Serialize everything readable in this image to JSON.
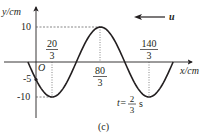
{
  "figure": {
    "caption": "(c)",
    "y_axis_label": "y/cm",
    "x_axis_label": "x/cm",
    "origin_label": "O",
    "y_ticks": [
      {
        "label": "10",
        "value": 10
      },
      {
        "label": "-5",
        "value": -5
      },
      {
        "label": "-10",
        "value": -10
      }
    ],
    "x_ticks": [
      {
        "num": "20",
        "den": "3",
        "value": 6.667
      },
      {
        "num": "80",
        "den": "3",
        "value": 26.667
      },
      {
        "num": "140",
        "den": "3",
        "value": 46.667
      }
    ],
    "velocity_label": "u",
    "velocity_direction": "left",
    "time_label": {
      "prefix": "t=",
      "num": "2",
      "den": "3",
      "unit": "s"
    },
    "wave": {
      "amplitude_cm": 10,
      "wavelength_cm": 40,
      "peak_x_cm": 26.667,
      "x_start_cm": -3.333,
      "x_end_cm": 56.667
    },
    "colors": {
      "ink": "#231f20",
      "dashed": "#555555"
    }
  },
  "chart_data": {
    "type": "line",
    "title": "",
    "xlabel": "x/cm",
    "ylabel": "y/cm",
    "x": [
      -3.333,
      0,
      6.667,
      16.667,
      26.667,
      36.667,
      46.667,
      56.667
    ],
    "series": [
      {
        "name": "wave at t=2/3 s",
        "values": [
          0,
          -5,
          -10,
          0,
          10,
          0,
          -10,
          0
        ]
      }
    ],
    "annotations": [
      "u (arrow pointing left)",
      "t=2/3 s",
      "(c)"
    ],
    "ylim": [
      -10,
      10
    ]
  }
}
